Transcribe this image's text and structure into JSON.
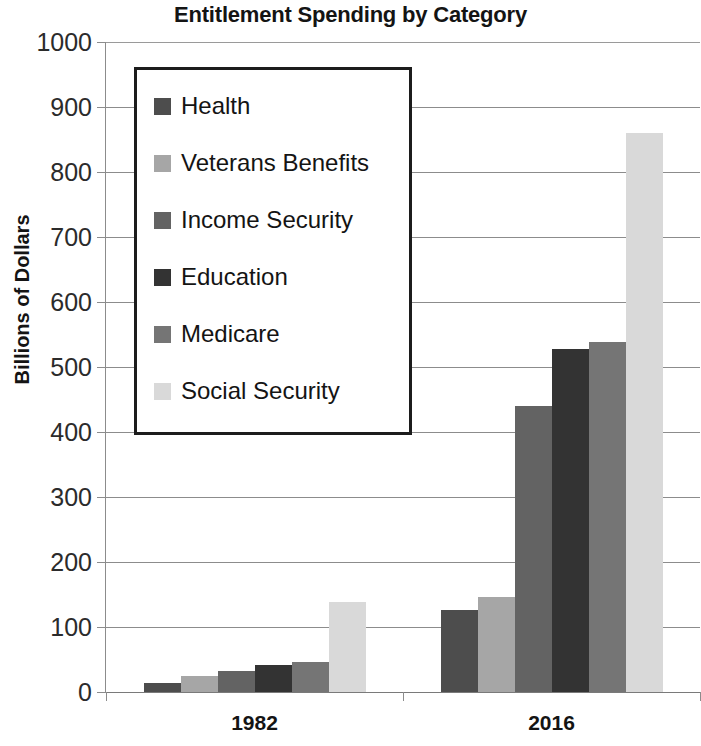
{
  "chart_data": {
    "type": "bar",
    "title": "Entitlement Spending by Category",
    "xlabel": "",
    "ylabel": "Billions of Dollars",
    "categories": [
      "1982",
      "2016"
    ],
    "ylim": [
      0,
      1000
    ],
    "y_ticks": [
      0,
      100,
      200,
      300,
      400,
      500,
      600,
      700,
      800,
      900,
      1000
    ],
    "y_tick_labels": [
      "0",
      "100",
      "200",
      "300",
      "400",
      "500",
      "600",
      "700",
      "800",
      "900",
      "1000"
    ],
    "grid": true,
    "legend_position": "upper-left-inside",
    "series": [
      {
        "name": "Health",
        "color": "#4d4d4d",
        "values": [
          14,
          126
        ]
      },
      {
        "name": "Veterans Benefits",
        "color": "#a6a6a6",
        "values": [
          25,
          146
        ]
      },
      {
        "name": "Income Security",
        "color": "#636363",
        "values": [
          33,
          440
        ]
      },
      {
        "name": "Education",
        "color": "#333333",
        "values": [
          41,
          528
        ]
      },
      {
        "name": "Medicare",
        "color": "#757575",
        "values": [
          46,
          538
        ]
      },
      {
        "name": "Social Security",
        "color": "#d9d9d9",
        "values": [
          139,
          860
        ]
      }
    ]
  },
  "axis": {
    "y_title": "Billions of Dollars"
  },
  "colors": {
    "grid": "#8c8c8c",
    "axis": "#8c8c8c",
    "text": "#141414",
    "legend_border": "#1c1c1c",
    "background": "#ffffff"
  }
}
